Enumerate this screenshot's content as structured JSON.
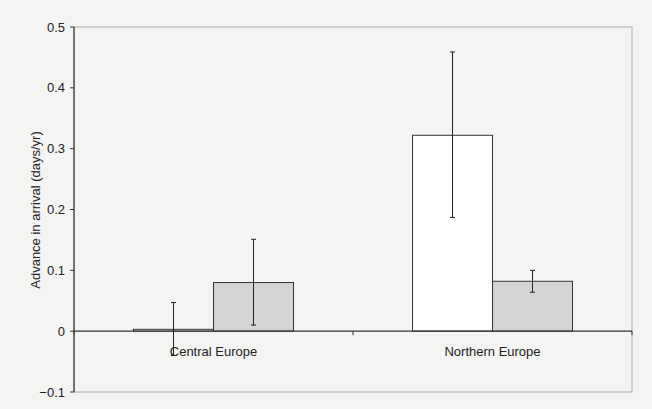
{
  "chart_data": {
    "type": "bar",
    "title": "",
    "xlabel": "",
    "ylabel": "Advance in arrival (days/yr)",
    "ylim": [
      -0.1,
      0.5
    ],
    "yticks": [
      -0.1,
      0,
      0.1,
      0.2,
      0.3,
      0.4,
      0.5
    ],
    "ytick_labels": [
      "−0.1",
      "0",
      "0.1",
      "0.2",
      "0.3",
      "0.4",
      "0.5"
    ],
    "grid": false,
    "legend": null,
    "categories": [
      "Central Europe",
      "Northern Europe"
    ],
    "series": [
      {
        "name": "Series 1",
        "color": "#ffffff",
        "values": [
          0.003,
          0.322
        ],
        "error_low": [
          -0.04,
          0.187
        ],
        "error_high": [
          0.047,
          0.459
        ]
      },
      {
        "name": "Series 2",
        "color": "#d4d4d4",
        "values": [
          0.08,
          0.082
        ],
        "error_low": [
          0.01,
          0.064
        ],
        "error_high": [
          0.151,
          0.1
        ]
      }
    ]
  },
  "colors": {
    "background": "#f4f4f2",
    "axis": "#333333",
    "plot_border": "#aaaaaa",
    "bar_outline": "#333333"
  }
}
